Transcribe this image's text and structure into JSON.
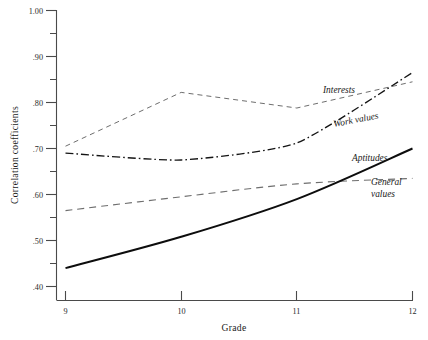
{
  "chart_data": {
    "type": "line",
    "title": "",
    "xlabel": "Grade",
    "ylabel": "Correlation coefficients",
    "x": [
      9,
      10,
      11,
      12
    ],
    "xlim": [
      9,
      12
    ],
    "ylim": [
      0.4,
      1.0
    ],
    "grid": false,
    "legend_position": "inline-right-annotations",
    "x_tick_labels": [
      "9",
      "10",
      "11",
      "12"
    ],
    "y_tick_labels": [
      ".40",
      ".50",
      ".60",
      ".70",
      ".80",
      ".90",
      "1.00"
    ],
    "y_major_ticks": [
      0.4,
      0.5,
      0.6,
      0.7,
      0.8,
      0.9,
      1.0
    ],
    "y_minor_ticks": [
      0.45,
      0.55,
      0.65,
      0.75,
      0.85,
      0.95
    ],
    "series": [
      {
        "name": "Interests",
        "style": "dashed",
        "values": [
          0.705,
          0.822,
          0.788,
          0.845
        ]
      },
      {
        "name": "Work values",
        "style": "dash-dot",
        "values": [
          0.69,
          0.675,
          0.712,
          0.865
        ]
      },
      {
        "name": "General values",
        "style": "long-dashed",
        "values": [
          0.565,
          0.595,
          0.623,
          0.635
        ]
      },
      {
        "name": "Aptitudes",
        "style": "solid",
        "values": [
          0.44,
          0.508,
          0.59,
          0.7
        ]
      }
    ],
    "annotations": [
      {
        "text": "Interests",
        "series": "Interests"
      },
      {
        "text": "Work values",
        "series": "Work values"
      },
      {
        "text": "Aptitudes",
        "series": "Aptitudes"
      },
      {
        "text": "General",
        "series": "General values"
      },
      {
        "text": "values",
        "series": "General values"
      }
    ],
    "colors": {
      "axis": "#4a4a4a",
      "aptitudes": "#0d0d0d",
      "interests": "#6e6e6e",
      "work_values": "#141414",
      "general_values": "#6e6e6e",
      "background": "#ffffff"
    }
  },
  "labels": {
    "y_axis_title": "Correlation coefficients",
    "x_axis_title": "Grade",
    "y_1_00": "1.00",
    "y_0_90": ".90",
    "y_0_80": ".80",
    "y_0_70": ".70",
    "y_0_60": ".60",
    "y_0_50": ".50",
    "y_0_40": ".40",
    "x_9": "9",
    "x_10": "10",
    "x_11": "11",
    "x_12": "12",
    "series_interests": "Interests",
    "series_work_values": "Work values",
    "series_aptitudes": "Aptitudes",
    "series_general_line1": "General",
    "series_general_line2": "values"
  }
}
